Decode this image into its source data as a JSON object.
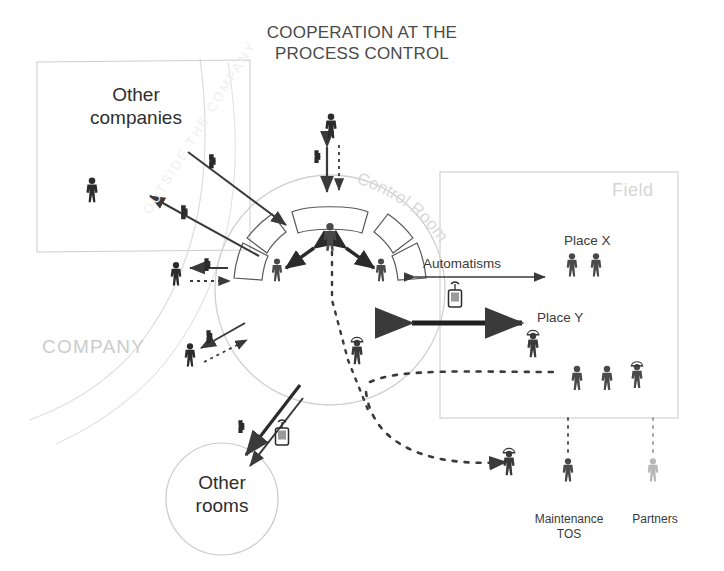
{
  "diagram": {
    "title_line1": "COOPERATION AT THE",
    "title_line2": "PROCESS CONTROL",
    "background": "#ffffff",
    "ink": "#3a3a3a",
    "ghost": "#cfcfcf"
  },
  "zones": {
    "outside_box_label_line1": "Other",
    "outside_box_label_line2": "companies",
    "outside_watermark": "OUTSIDE THE COMPANY",
    "company_label": "COMPANY",
    "control_room_label": "Control Room",
    "field_label": "Field",
    "other_rooms_line1": "Other",
    "other_rooms_line2": "rooms"
  },
  "labels": {
    "automatisms": "Automatisms",
    "place_x": "Place X",
    "place_y": "Place Y",
    "maintenance_line1": "Maintenance",
    "maintenance_line2": "TOS",
    "partners": "Partners"
  },
  "icons": {
    "telephone": "telephone-handset-icon",
    "mobile_radio": "mobile-radio-icon",
    "person": "person-icon",
    "person_helmet": "person-with-helmet-icon"
  },
  "actors": {
    "outside_company_person": 1,
    "control_room_operators": 3,
    "company_phone_users": 2,
    "top_visitor": 1,
    "lower_company_worker": 1,
    "place_x_workers": 2,
    "place_y_worker": 1,
    "field_group_workers": 3,
    "maintenance_worker": 1,
    "partner_worker": 1
  },
  "link_types": {
    "solid_arrow": "face-to-face / direct link",
    "thick_arrow": "strong direct cooperation",
    "dashed_arrow": "mediated / remote link",
    "phone_marker": "telephone mediated"
  }
}
